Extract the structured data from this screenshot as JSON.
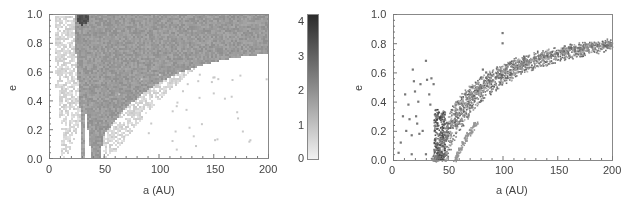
{
  "chart_data": [
    {
      "type": "heatmap",
      "title": "",
      "xlabel": "a (AU)",
      "ylabel": "e",
      "xlim": [
        0,
        200
      ],
      "ylim": [
        0,
        1.0
      ],
      "xticks": [
        "0",
        "50",
        "100",
        "150",
        "200"
      ],
      "yticks": [
        "0.0",
        "0.2",
        "0.4",
        "0.6",
        "0.8",
        "1.0"
      ],
      "grid": false,
      "colorbar": {
        "range": [
          0,
          4.2
        ],
        "ticks": [
          "0",
          "1",
          "2",
          "3",
          "4"
        ],
        "colormap": "grayscale (light = low, dark = high)"
      },
      "regions": [
        {
          "description": "dense band, density ~2",
          "a_range": [
            20,
            200
          ],
          "e_min_at_a": [
            [
              30,
              0.0
            ],
            [
              45,
              0.0
            ],
            [
              60,
              0.25
            ],
            [
              100,
              0.5
            ],
            [
              150,
              0.65
            ],
            [
              200,
              0.75
            ]
          ],
          "value": 2.0
        },
        {
          "description": "outer sparse band, density ~0.7",
          "a_range": [
            5,
            200
          ],
          "value": 0.7
        },
        {
          "description": "peak near a=30, e=1.0",
          "a": 30,
          "e": 0.98,
          "value": 3.5
        }
      ]
    },
    {
      "type": "scatter",
      "title": "",
      "xlabel": "a (AU)",
      "ylabel": "e",
      "xlim": [
        0,
        200
      ],
      "ylim": [
        0,
        1.0
      ],
      "xticks": [
        "0",
        "50",
        "100",
        "150",
        "200"
      ],
      "yticks": [
        "0.0",
        "0.2",
        "0.4",
        "0.6",
        "0.8",
        "1.0"
      ],
      "grid": false,
      "description": "Particles follow curved band of constant perihelion q≈40-45 AU rising from e=0 at a≈40-45 to e≈0.88 at a=200; secondary curve starting at a≈57; scattered points at a<40",
      "bands": [
        {
          "q": 38,
          "width": 4
        },
        {
          "q": 43,
          "width": 5
        },
        {
          "q": 56,
          "width": 1.5
        }
      ],
      "isolated_points": [
        [
          5,
          0.05
        ],
        [
          7,
          0.12
        ],
        [
          9,
          0.3
        ],
        [
          11,
          0.45
        ],
        [
          12,
          0.2
        ],
        [
          14,
          0.38
        ],
        [
          15,
          0.28
        ],
        [
          17,
          0.17
        ],
        [
          18,
          0.62
        ],
        [
          19,
          0.54
        ],
        [
          20,
          0.47
        ],
        [
          21,
          0.3
        ],
        [
          22,
          0.25
        ],
        [
          23,
          0.4
        ],
        [
          24,
          0.18
        ],
        [
          25,
          0.52
        ],
        [
          27,
          0.2
        ],
        [
          30,
          0.68
        ],
        [
          31,
          0.55
        ],
        [
          33,
          0.45
        ],
        [
          34,
          0.38
        ],
        [
          35,
          0.56
        ],
        [
          37,
          0.52
        ],
        [
          17,
          0.04
        ],
        [
          30,
          0.04
        ],
        [
          100,
          0.87
        ],
        [
          100,
          0.8
        ],
        [
          103,
          0.65
        ],
        [
          107,
          0.66
        ],
        [
          120,
          0.69
        ],
        [
          129,
          0.7
        ],
        [
          166,
          0.77
        ],
        [
          82,
          0.62
        ],
        [
          85,
          0.6
        ],
        [
          90,
          0.58
        ],
        [
          72,
          0.5
        ],
        [
          66,
          0.45
        ],
        [
          68,
          0.42
        ]
      ]
    }
  ],
  "left_panel": {
    "xlabel": "a (AU)",
    "ylabel": "e",
    "xticks": [
      "0",
      "50",
      "100",
      "150",
      "200"
    ],
    "yticks": [
      "0.0",
      "0.2",
      "0.4",
      "0.6",
      "0.8",
      "1.0"
    ],
    "colorbar_ticks": [
      "0",
      "1",
      "2",
      "3",
      "4"
    ]
  },
  "right_panel": {
    "xlabel": "a (AU)",
    "ylabel": "e",
    "xticks": [
      "0",
      "50",
      "100",
      "150",
      "200"
    ],
    "yticks": [
      "0.0",
      "0.2",
      "0.4",
      "0.6",
      "0.8",
      "1.0"
    ]
  }
}
